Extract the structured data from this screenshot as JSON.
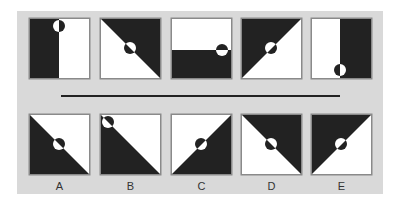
{
  "colors": {
    "panel": "#d9d9d9",
    "dark": "#222222",
    "light": "#ffffff",
    "border": "#8a8a8a",
    "separator": "#222222"
  },
  "box_size": 61,
  "circle_radius": 6,
  "separator": {
    "x1": 61,
    "x2": 340,
    "y": 96,
    "width": 2
  },
  "question_row": {
    "y": 18,
    "figures": [
      {
        "x": 29,
        "dark_polygon": [
          [
            0,
            0
          ],
          [
            30,
            0
          ],
          [
            30,
            61
          ],
          [
            0,
            61
          ]
        ],
        "circle": [
          30,
          8
        ],
        "divider_angle": 90
      },
      {
        "x": 100,
        "dark_polygon": [
          [
            0,
            0
          ],
          [
            61,
            0
          ],
          [
            61,
            61
          ]
        ],
        "circle": [
          30,
          30
        ],
        "divider_angle": 45
      },
      {
        "x": 171,
        "dark_polygon": [
          [
            0,
            32
          ],
          [
            61,
            32
          ],
          [
            61,
            61
          ],
          [
            0,
            61
          ]
        ],
        "circle": [
          51,
          32
        ],
        "divider_angle": 0
      },
      {
        "x": 241,
        "dark_polygon": [
          [
            0,
            0
          ],
          [
            61,
            0
          ],
          [
            0,
            61
          ]
        ],
        "circle": [
          30,
          30
        ],
        "divider_angle": -45
      },
      {
        "x": 311,
        "dark_polygon": [
          [
            29,
            0
          ],
          [
            61,
            0
          ],
          [
            61,
            61
          ],
          [
            29,
            61
          ]
        ],
        "circle": [
          29,
          52
        ],
        "divider_angle": 90
      }
    ]
  },
  "answer_row": {
    "y": 114,
    "figures": [
      {
        "label": "A",
        "x": 29,
        "dark_polygon": [
          [
            0,
            0
          ],
          [
            61,
            61
          ],
          [
            0,
            61
          ]
        ],
        "circle": [
          30,
          30
        ],
        "divider_angle": 45
      },
      {
        "label": "B",
        "x": 100,
        "dark_polygon": [
          [
            0,
            0
          ],
          [
            61,
            61
          ],
          [
            0,
            61
          ]
        ],
        "circle": [
          8,
          8
        ],
        "divider_angle": 45
      },
      {
        "label": "C",
        "x": 171,
        "dark_polygon": [
          [
            61,
            0
          ],
          [
            61,
            61
          ],
          [
            0,
            61
          ]
        ],
        "circle": [
          30,
          30
        ],
        "divider_angle": -45
      },
      {
        "label": "D",
        "x": 241,
        "dark_polygon": [
          [
            0,
            0
          ],
          [
            61,
            0
          ],
          [
            61,
            61
          ]
        ],
        "circle": [
          30,
          30
        ],
        "divider_angle": 45
      },
      {
        "label": "E",
        "x": 311,
        "dark_polygon": [
          [
            0,
            0
          ],
          [
            61,
            0
          ],
          [
            0,
            61
          ]
        ],
        "circle": [
          30,
          30
        ],
        "divider_angle": -45
      }
    ]
  },
  "labels_y": 180
}
